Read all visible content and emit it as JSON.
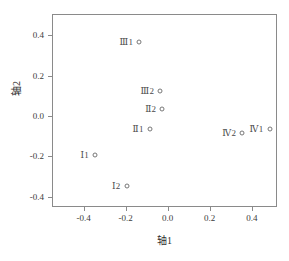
{
  "chart_data": {
    "type": "scatter",
    "title": "",
    "xlabel": "轴1",
    "ylabel": "轴2",
    "xlim": [
      -0.55,
      0.52
    ],
    "ylim": [
      -0.45,
      0.505
    ],
    "xticks": [
      -0.4,
      -0.2,
      0.0,
      0.2,
      0.4
    ],
    "xticklabels": [
      "-0.4",
      "-0.2",
      "0.0",
      "0.2",
      "0.4"
    ],
    "yticks": [
      -0.4,
      -0.2,
      0.0,
      0.2,
      0.4
    ],
    "yticklabels": [
      "-0.4",
      "-0.2",
      "0.0",
      "0.2",
      "0.4"
    ],
    "grid": false,
    "legend": false,
    "marker": "open-circle",
    "marker_color": "#777777",
    "points": [
      {
        "label": "Ⅲ1",
        "x": -0.14,
        "y": 0.37,
        "label_side": "left"
      },
      {
        "label": "Ⅲ2",
        "x": -0.04,
        "y": 0.13,
        "label_side": "left"
      },
      {
        "label": "Ⅱ2",
        "x": -0.03,
        "y": 0.04,
        "label_side": "left"
      },
      {
        "label": "Ⅱ1",
        "x": -0.09,
        "y": -0.06,
        "label_side": "left"
      },
      {
        "label": "Ⅰ1",
        "x": -0.35,
        "y": -0.19,
        "label_side": "left"
      },
      {
        "label": "Ⅰ2",
        "x": -0.2,
        "y": -0.34,
        "label_side": "left"
      },
      {
        "label": "Ⅳ2",
        "x": 0.35,
        "y": -0.08,
        "label_side": "left"
      },
      {
        "label": "Ⅳ1",
        "x": 0.48,
        "y": -0.06,
        "label_side": "left"
      }
    ]
  },
  "colors": {
    "axis": "#8a8a8a",
    "text": "#3c3c3c",
    "marker": "#777777",
    "background": "#ffffff"
  }
}
